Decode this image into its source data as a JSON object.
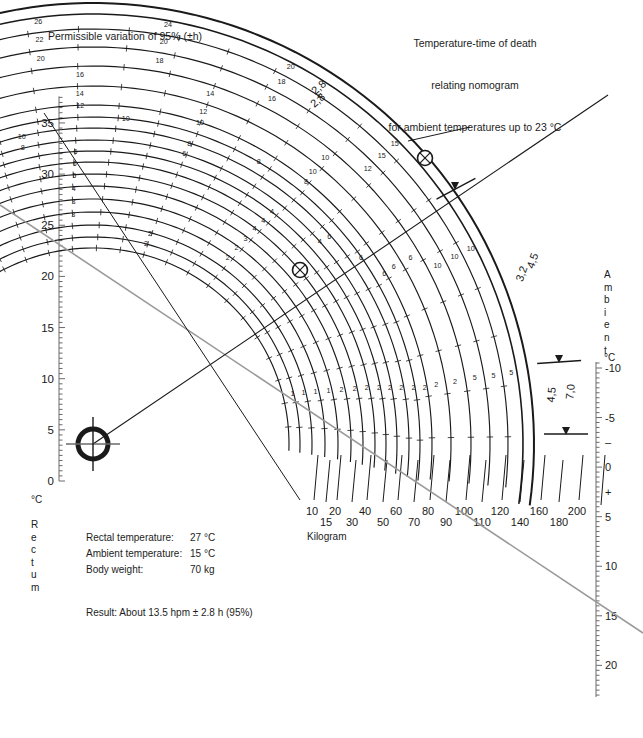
{
  "headers": {
    "left": "Permissible variation of 95% (±h)",
    "right_line1": "Temperature-time of death",
    "right_line2": "relating nomogram",
    "right_line3": "for ambient temperatures up to 23 °C"
  },
  "arc_captions": {
    "corrective": "Using corrective factors",
    "standard": "Standard (naked–still air)"
  },
  "outer_band_labels": [
    "2,8",
    "2,8",
    "3,2",
    "4,5",
    "4,5",
    "7,0"
  ],
  "axes": {
    "rectum": {
      "title_deg": "°C",
      "title_letters": [
        "R",
        "e",
        "c",
        "t",
        "u",
        "m"
      ],
      "ticks": [
        0,
        5,
        10,
        15,
        20,
        25,
        30,
        35
      ],
      "min": 0,
      "max": 37.5
    },
    "ambient": {
      "title_letters": [
        "A",
        "m",
        "b",
        "i",
        "e",
        "n",
        "t"
      ],
      "title_deg": "°C",
      "ticks": [
        "-10",
        "-5",
        "–",
        "0",
        "+",
        "5",
        "10",
        "15",
        "20"
      ],
      "tick_values": [
        -10,
        -5,
        -2.5,
        0,
        2.5,
        5,
        10,
        15,
        20
      ],
      "min": -11,
      "max": 23
    },
    "kilogram": {
      "label": "Kilogram",
      "upper_row": [
        "10",
        "20",
        "40",
        "60",
        "80",
        "100",
        "120",
        "160",
        "200"
      ],
      "lower_row": [
        "15",
        "30",
        "50",
        "70",
        "90",
        "110",
        "140",
        "180"
      ]
    }
  },
  "weight_curve_labels_left": [
    "80",
    "70",
    "60",
    "50",
    "40",
    "30",
    "20",
    "15",
    "10"
  ],
  "weight_curve_labels_top": [
    "90",
    "100",
    "110",
    "120",
    "140",
    "160",
    "180",
    "200"
  ],
  "inputs": {
    "rows": [
      {
        "label": "Rectal temperature:",
        "value": "27 °C"
      },
      {
        "label": "Ambient temperature:",
        "value": "15 °C"
      },
      {
        "label": "Body weight:",
        "value": "70 kg"
      }
    ]
  },
  "result": {
    "text": "Result: About 13.5 hpm ± 2.8 h (95%)"
  },
  "colors": {
    "ink": "#1a1a1a",
    "curve": "#1a1a1a",
    "construction_gray": "#9a9a9a",
    "axis": "#6a6a6a"
  },
  "chart_data": {
    "type": "line",
    "title": "Temperature-time of death relating nomogram",
    "pole": {
      "x": 93,
      "y": 444
    },
    "rectum_axis_x": 59,
    "rectum_axis_y0": 481,
    "rectum_px_per_deg": 10.23,
    "weight_arcs_kg": [
      10,
      15,
      20,
      30,
      40,
      50,
      60,
      70,
      80,
      90,
      100,
      110,
      120,
      140,
      160,
      180,
      200
    ],
    "weight_arc_radii": [
      196,
      207,
      219,
      232,
      245,
      258,
      270,
      282,
      293,
      304,
      316,
      327,
      339,
      358,
      378,
      397,
      415
    ],
    "hour_ticks_per_arc": {
      "10": [
        1,
        2
      ],
      "15": [
        1,
        2
      ],
      "20": [
        1,
        2,
        3
      ],
      "30": [
        1,
        2,
        3
      ],
      "40": [
        2,
        3,
        4
      ],
      "50": [
        2,
        4,
        5
      ],
      "60": [
        2,
        4,
        6
      ],
      "70": [
        2,
        4,
        6
      ],
      "80": [
        2,
        4,
        6,
        8
      ],
      "90": [
        2,
        6,
        8,
        10
      ],
      "100": [
        2,
        6,
        8,
        10,
        12
      ],
      "110": [
        2,
        6,
        8,
        10,
        12,
        14
      ],
      "120": [
        2,
        6,
        10,
        12,
        14,
        16
      ],
      "140": [
        2,
        6,
        10,
        14,
        16,
        18
      ],
      "160": [
        5,
        10,
        12,
        16,
        18,
        20,
        22
      ],
      "180": [
        5,
        10,
        15,
        18,
        20,
        22,
        24
      ],
      "200": [
        5,
        10,
        15,
        20,
        24,
        26,
        28
      ]
    },
    "markers": [
      {
        "name": "pole-crosshair",
        "x": 93,
        "y": 444
      },
      {
        "name": "intersection-inner",
        "x": 300,
        "y": 270
      },
      {
        "name": "intersection-outer",
        "x": 425,
        "y": 158
      },
      {
        "name": "band-arrow-upper",
        "x": 455,
        "y": 187
      },
      {
        "name": "band-arrow-mid",
        "x": 559,
        "y": 360
      },
      {
        "name": "band-arrow-lower",
        "x": 566,
        "y": 432
      }
    ],
    "construction_lines": [
      {
        "name": "rectum-to-ambient",
        "x1": 0,
        "y1": 205,
        "x2": 643,
        "y2": 633
      },
      {
        "name": "pole-to-kilogram",
        "x1": 93,
        "y1": 444,
        "x2": 605,
        "y2": 100
      }
    ],
    "xlabel": "Kilogram",
    "ylabel": "Rectum °C",
    "y2label": "Ambient °C"
  }
}
